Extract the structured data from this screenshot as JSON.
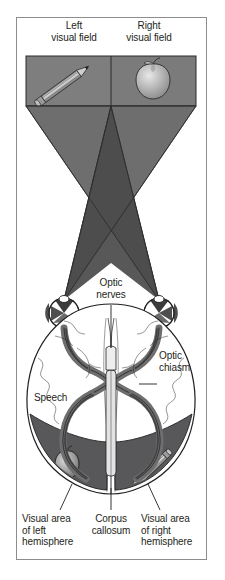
{
  "figure": {
    "title_left": "Left\nvisual field",
    "title_right": "Right\nvisual field",
    "labels": {
      "optic_nerves": "Optic\nnerves",
      "optic_chiasm": "Optic\nchiasm",
      "speech": "Speech",
      "visual_area_left": "Visual area\nof left\nhemisphere",
      "corpus_callosum": "Corpus\ncallosum",
      "visual_area_right": "Visual area\nof right\nhemisphere"
    },
    "objects": {
      "left_field_object": "pencil-icon",
      "right_field_object": "apple-icon",
      "left_hemisphere_object": "apple-icon",
      "right_hemisphere_object": "pencil-icon"
    },
    "colors": {
      "frame_border": "#8d8d8d",
      "panel_fill": "#808080",
      "cone_fill": "#6e6e6e",
      "cone_overlap_fill": "#4a4a4a",
      "visual_area_fill": "#58585a",
      "brain_fill": "#ffffff",
      "outline": "#231f20",
      "text": "#231f20",
      "nerve_fill": "#6e6e6e",
      "nerve_dark": "#3b3b3b"
    }
  }
}
